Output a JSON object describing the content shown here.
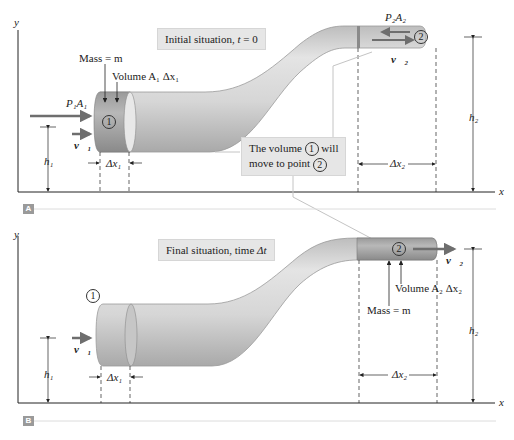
{
  "figure": {
    "panels": [
      {
        "id": "A",
        "tag": "A",
        "axis_y": "y",
        "axis_x": "x",
        "title_callout": "Initial situation, t = 0",
        "title_prefix": "Initial situation, ",
        "title_var": "t",
        "title_suffix": " = 0",
        "labels": {
          "mass": "Mass = m",
          "volume": "Volume A₁ Δx₁",
          "force1": "P₁A₁",
          "velocity1": "v⃗₁",
          "point1": "1",
          "h1": "h₁",
          "dx1": "Δx₁",
          "force2": "P₂A₂",
          "velocity2": "v⃗₂",
          "point2": "2",
          "h2": "h₂",
          "dx2": "Δx₂"
        },
        "note_callout": {
          "line1_a": "The volume ",
          "line1_circ": "1",
          "line1_b": " will",
          "line2_a": "move to point ",
          "line2_circ": "2"
        }
      },
      {
        "id": "B",
        "tag": "B",
        "axis_y": "y",
        "axis_x": "x",
        "title_prefix": "Final situation, time ",
        "title_var": "Δt",
        "labels": {
          "point1": "1",
          "velocity1": "v⃗₁",
          "h1": "h₁",
          "dx1": "Δx₁",
          "point2": "2",
          "velocity2": "v⃗₂",
          "volume": "Volume A₂ Δx₂",
          "mass": "Mass = m",
          "h2": "h₂",
          "dx2": "Δx₂"
        }
      }
    ],
    "colors": {
      "pipe_light": "#d9d9d9",
      "pipe_mid": "#c4c4c4",
      "pipe_dark": "#8f8f8f",
      "fluid_element": "#a8a8a8",
      "arrow": "#6e6e6e",
      "callout_bg": "#e6e6e6",
      "axis": "#222222",
      "leader": "#bdbdbd"
    }
  }
}
